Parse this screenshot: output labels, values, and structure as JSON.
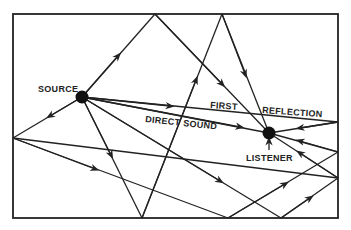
{
  "diagram": {
    "labels": {
      "source": "SOURCE",
      "listener": "LISTENER",
      "direct_sound": "DIRECT SOUND",
      "first": "FIRST",
      "reflection": "REFLECTION"
    },
    "colors": {
      "ink": "#222222",
      "background": "#ffffff"
    }
  }
}
